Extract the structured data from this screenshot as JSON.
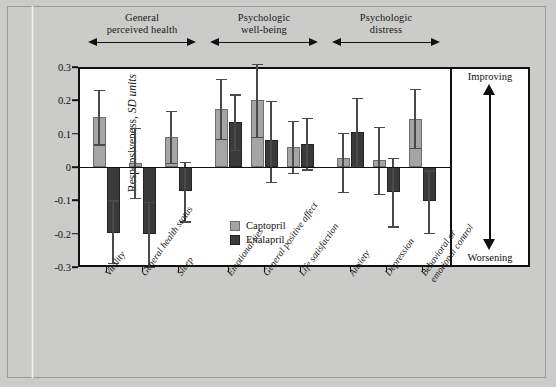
{
  "figure": {
    "y_axis_label_main": "Responsiveness, ",
    "y_axis_label_italic": "SD units",
    "direction_up": "Improving",
    "direction_down": "Worsening"
  },
  "legend": {
    "items": [
      {
        "label": "Captopril",
        "color": "#a5a5a5"
      },
      {
        "label": "Enalapril",
        "color": "#3a3a3a"
      }
    ]
  },
  "groups": [
    {
      "title": "General\nperceived health",
      "span": [
        0,
        2
      ]
    },
    {
      "title": "Psychologic\nwell-being",
      "span": [
        3,
        5
      ]
    },
    {
      "title": "Psychologic\ndistress",
      "span": [
        6,
        8
      ]
    }
  ],
  "chart_data": {
    "type": "bar",
    "title": "",
    "xlabel": "",
    "ylabel": "Responsiveness, SD units",
    "ylim": [
      -0.3,
      0.3
    ],
    "yticks": [
      "0.3",
      "0.2",
      "0.1",
      "0",
      "-0.1",
      "-0.2",
      "-0.3"
    ],
    "ytick_values": [
      0.3,
      0.2,
      0.1,
      0,
      -0.1,
      -0.2,
      -0.3
    ],
    "grid": false,
    "legend_position": "inside-center",
    "categories": [
      "Vitality",
      "General health status",
      "Sleep",
      "Emotional ties",
      "General positive affect",
      "Life satisfaction",
      "Anxiety",
      "Depression",
      "Behavioral or\nemotional control"
    ],
    "series": [
      {
        "name": "Captopril",
        "color": "#a5a5a5",
        "values": [
          0.15,
          0.013,
          0.09,
          0.175,
          0.2,
          0.06,
          0.027,
          0.02,
          0.145
        ],
        "err_low": [
          0.068,
          -0.092,
          0.012,
          0.085,
          0.09,
          -0.017,
          -0.075,
          -0.08,
          0.058
        ],
        "err_high": [
          0.232,
          0.117,
          0.168,
          0.265,
          0.31,
          0.138,
          0.102,
          0.12,
          0.235
        ]
      },
      {
        "name": "Enalapril",
        "color": "#3a3a3a",
        "values": [
          -0.198,
          -0.202,
          -0.072,
          0.135,
          0.082,
          0.07,
          0.105,
          -0.075,
          -0.103
        ],
        "err_low": [
          -0.288,
          -0.3,
          -0.163,
          0.052,
          -0.045,
          -0.007,
          0.002,
          -0.178,
          -0.198
        ],
        "err_high": [
          -0.1,
          -0.105,
          0.015,
          0.218,
          0.198,
          0.148,
          0.208,
          0.028,
          -0.01
        ]
      }
    ],
    "annotations": [
      "General perceived health",
      "Psychologic well-being",
      "Psychologic distress",
      "Improving",
      "Worsening"
    ]
  }
}
